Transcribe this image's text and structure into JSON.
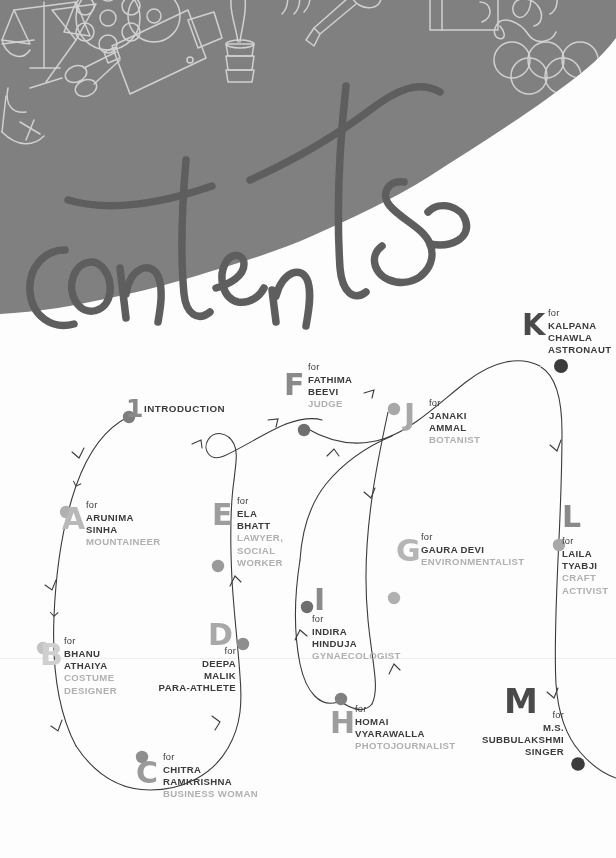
{
  "page": {
    "background_color": "#ffffff"
  },
  "header": {
    "script_title": "contents",
    "band_color": "#808080",
    "script_color": "#5e5e5e",
    "doodle_color": "#d8d8d8",
    "doodles": [
      "scales-icon",
      "wine-glass-icon",
      "film-reel-icon",
      "movie-camera-icon",
      "scissors-icon",
      "trophy-icon",
      "inkpot-icon",
      "microphone-icon",
      "camera-icon",
      "ribbon-icon",
      "olympic-rings-icon",
      "shoe-icon"
    ]
  },
  "flow": {
    "line_color": "#3b3b3b",
    "intro_label": "INTRODUCTION",
    "intro_marker": "1"
  },
  "entries": [
    {
      "letter": "A",
      "for": "for",
      "name_lines": [
        "ARUNIMA",
        "SINHA"
      ],
      "role": "MOUNTAINEER",
      "letter_color": "#b8b8b8",
      "dot_color": "#b0b0b0",
      "align": "left"
    },
    {
      "letter": "B",
      "for": "for",
      "name_lines": [
        "BHANU",
        "ATHAIYA"
      ],
      "role_lines": [
        "COSTUME",
        "DESIGNER"
      ],
      "letter_color": "#cfcfcf",
      "dot_color": "#c3c3c3",
      "align": "left"
    },
    {
      "letter": "C",
      "for": "for",
      "name_lines": [
        "CHITRA",
        "RAMKRISHNA"
      ],
      "role": "BUSINESS WOMAN",
      "letter_color": "#9a9a9a",
      "dot_color": "#8e8e8e",
      "align": "left"
    },
    {
      "letter": "D",
      "for": "for",
      "name_lines": [
        "DEEPA",
        "MALIK"
      ],
      "role": "PARA-ATHLETE",
      "role_dark": true,
      "letter_color": "#a8a8a8",
      "dot_color": "#8e8e8e",
      "align": "right"
    },
    {
      "letter": "E",
      "for": "for",
      "name_lines": [
        "ELA",
        "BHATT"
      ],
      "role_lines": [
        "LAWYER,",
        "SOCIAL",
        "WORKER"
      ],
      "letter_color": "#9d9d9d",
      "dot_color": "#9a9a9a",
      "align": "left"
    },
    {
      "letter": "F",
      "for": "for",
      "name_lines": [
        "FATHIMA",
        "BEEVI"
      ],
      "role": "JUDGE",
      "letter_color": "#8a8a8a",
      "dot_color": "#6e6e6e",
      "align": "left"
    },
    {
      "letter": "G",
      "for": "for",
      "name_lines": [
        "GAURA DEVI"
      ],
      "role": "ENVIRONMENTALIST",
      "letter_color": "#b5b5b5",
      "dot_color": "#b0b0b0",
      "align": "left"
    },
    {
      "letter": "H",
      "for": "for",
      "name_lines": [
        "HOMAI",
        "VYARAWALLA"
      ],
      "role": "PHOTOJOURNALIST",
      "letter_color": "#9d9d9d",
      "dot_color": "#808080",
      "align": "left"
    },
    {
      "letter": "I",
      "for": "for",
      "name_lines": [
        "INDIRA",
        "HINDUJA"
      ],
      "role": "GYNAECOLOGIST",
      "letter_color": "#8a8a8a",
      "dot_color": "#6e6e6e",
      "align": "left"
    },
    {
      "letter": "J",
      "for": "for",
      "name_lines": [
        "JANAKI",
        "AMMAL"
      ],
      "role": "BOTANIST",
      "letter_color": "#a8a8a8",
      "dot_color": "#a8a8a8",
      "align": "left"
    },
    {
      "letter": "K",
      "for": "for",
      "name_lines": [
        "KALPANA",
        "CHAWLA"
      ],
      "role": "ASTRONAUT",
      "role_dark": true,
      "letter_color": "#4a4a4a",
      "dot_color": "#3b3b3b",
      "align": "left"
    },
    {
      "letter": "L",
      "for": "for",
      "name_lines": [
        "LAILA",
        "TYABJI"
      ],
      "role_lines": [
        "CRAFT",
        "ACTIVIST"
      ],
      "letter_color": "#8a8a8a",
      "dot_color": "#a8a8a8",
      "align": "left"
    },
    {
      "letter": "M",
      "for": "for",
      "name_lines": [
        "M.S.",
        "SUBBULAKSHMI"
      ],
      "role": "SINGER",
      "role_dark": true,
      "letter_color": "#4a4a4a",
      "dot_color": "#3b3b3b",
      "align": "right"
    }
  ]
}
